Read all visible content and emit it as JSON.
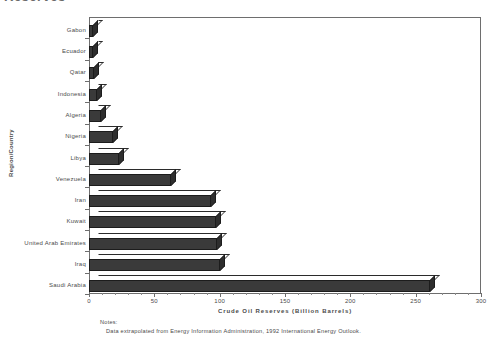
{
  "chart_title": "Reserves",
  "chart_data": {
    "type": "bar",
    "orientation": "horizontal",
    "title": "Reserves",
    "xlabel": "Crude  Oil  Reserves  (Billion  Barrels)",
    "ylabel": "Region/Country",
    "xlim": [
      0,
      300
    ],
    "xticks": [
      0,
      50,
      100,
      150,
      200,
      250,
      300
    ],
    "xtick_labels": [
      "0",
      "50",
      "100",
      "150",
      "200",
      "250",
      "300"
    ],
    "minor_tick_step": 10,
    "grid": false,
    "legend": null,
    "categories": [
      "Gabon",
      "Ecuador",
      "Qatar",
      "Indonesia",
      "Algeria",
      "Nigeria",
      "Libya",
      "Venezuela",
      "Iran",
      "Kuwait",
      "United Arab Emirates",
      "Iraq",
      "Saudi Arabia"
    ],
    "values": [
      3,
      3,
      4,
      6,
      9,
      18,
      23,
      63,
      93,
      97,
      98,
      100,
      261
    ],
    "bar_fill_color": "#3a3a3a",
    "bar_edge_color": "#1c1c1c",
    "bar_top_color": "#ffffff",
    "plot_background": "#ffffff",
    "axis_color": "#6e6e6e"
  },
  "notes": {
    "heading": "Notes:",
    "body": "Data extrapolated from Energy Information Administration, 1992 International Energy Outlook."
  }
}
